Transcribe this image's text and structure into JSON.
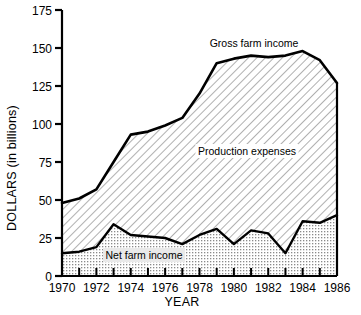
{
  "chart_data": {
    "type": "area",
    "title": "",
    "xlabel": "YEAR",
    "ylabel": "DOLLARS (in billions)",
    "xlim": [
      1970,
      1986
    ],
    "ylim": [
      0,
      175
    ],
    "yticks": [
      0,
      25,
      50,
      75,
      100,
      125,
      150,
      175
    ],
    "ytick_labels": [
      "0",
      "25",
      "50",
      "75",
      "100",
      "125",
      "150",
      "175"
    ],
    "xticks": [
      1970,
      1971,
      1972,
      1973,
      1974,
      1975,
      1976,
      1977,
      1978,
      1979,
      1980,
      1981,
      1982,
      1983,
      1984,
      1985,
      1986
    ],
    "xtick_labels": [
      "1970",
      "1972",
      "1974",
      "1976",
      "1978",
      "1980",
      "1982",
      "1984",
      "1986"
    ],
    "xtick_label_years": [
      1970,
      1972,
      1974,
      1976,
      1978,
      1980,
      1982,
      1984,
      1986
    ],
    "grid": false,
    "legend_position": "inline-annotations",
    "x": [
      1970,
      1971,
      1972,
      1973,
      1974,
      1975,
      1976,
      1977,
      1978,
      1979,
      1980,
      1981,
      1982,
      1983,
      1984,
      1985,
      1986
    ],
    "series": [
      {
        "name": "Gross farm income",
        "values": [
          48,
          51,
          57,
          75,
          93,
          95,
          99,
          104,
          120,
          140,
          143,
          145,
          144,
          145,
          148,
          142,
          127
        ]
      },
      {
        "name": "Net farm income",
        "values": [
          15,
          16,
          19,
          34,
          27,
          26,
          25,
          21,
          27,
          31,
          21,
          30,
          28,
          15,
          36,
          35,
          40
        ]
      }
    ],
    "bands": [
      {
        "name": "Production expenses",
        "description": "Region between Net farm income and Gross farm income",
        "fill": "diagonal-hatch"
      },
      {
        "name": "Net farm income",
        "description": "Region between baseline and Net farm income",
        "fill": "dotted-stipple"
      }
    ],
    "annotations": [
      {
        "text": "Gross farm income",
        "x": 1980,
        "y": 160
      },
      {
        "text": "Production expenses",
        "x": 1980,
        "y": 93
      },
      {
        "text": "Net farm income",
        "x": 1975,
        "y": 10
      }
    ],
    "colors": {
      "line": "#000000",
      "axis": "#000000",
      "background": "#ffffff",
      "hatch": "#7a7a7a",
      "stipple": "#9a9a9a"
    }
  },
  "axes": {
    "y_title": "DOLLARS (in billions)",
    "x_title": "YEAR"
  },
  "labels": {
    "gross_farm_income": "Gross farm income",
    "production_expenses": "Production expenses",
    "net_farm_income": "Net farm income"
  }
}
